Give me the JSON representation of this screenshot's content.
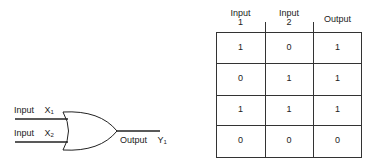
{
  "gate": {
    "type": "OR",
    "input1_label": "Input",
    "input1_var": "X",
    "input1_sub": "1",
    "input2_label": "Input",
    "input2_var": "X",
    "input2_sub": "2",
    "output_label": "Output",
    "output_var": "Y",
    "output_sub": "1"
  },
  "truth_table": {
    "headers": [
      {
        "line1": "Input",
        "line2": "1"
      },
      {
        "line1": "Input",
        "line2": "2"
      },
      {
        "line1": "Output",
        "line2": ""
      }
    ],
    "rows": [
      [
        "1",
        "0",
        "1"
      ],
      [
        "0",
        "1",
        "1"
      ],
      [
        "1",
        "1",
        "1"
      ],
      [
        "0",
        "0",
        "0"
      ]
    ]
  }
}
